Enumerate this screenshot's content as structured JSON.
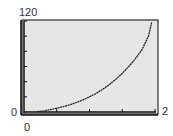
{
  "chart_data": {
    "type": "line",
    "title": "",
    "xlabel": "",
    "ylabel": "",
    "xlim": [
      0,
      2
    ],
    "ylim": [
      0,
      120
    ],
    "x_tick_step": 0.5,
    "y_tick_step": 20,
    "grid": false,
    "legend": null,
    "tick_labels": {
      "y_max": "120",
      "y_min": "0",
      "x_min": "0",
      "x_max": "2"
    },
    "series": [
      {
        "name": "curve",
        "x": [
          0.2,
          0.3,
          0.4,
          0.5,
          0.6,
          0.7,
          0.8,
          0.9,
          1.0,
          1.1,
          1.2,
          1.3,
          1.4,
          1.5,
          1.6,
          1.7,
          1.8,
          1.9,
          1.95
        ],
        "y": [
          0.5,
          1.5,
          3,
          5,
          7,
          9.5,
          12.5,
          16,
          20,
          24.5,
          30,
          36,
          43,
          51,
          60,
          70,
          82,
          100,
          118
        ]
      }
    ]
  },
  "colors": {
    "plot_background": "#e6e6e6",
    "frame": "#2a2a2a",
    "curve": "#222222",
    "label": "#333333"
  }
}
